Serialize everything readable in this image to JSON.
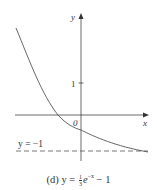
{
  "axes": {
    "x_label": "x",
    "y_label": "y",
    "origin_label": "0",
    "y_tick_label": "1"
  },
  "asymptote": {
    "label": "y = −1",
    "style": "dashed"
  },
  "caption": {
    "prefix": "(d) y = ",
    "frac_num": "1",
    "frac_den": "3",
    "base": "e",
    "exponent": "−x",
    "suffix": " − 1"
  },
  "colors": {
    "curve": "#555555",
    "axis": "#444444",
    "text": "#333333"
  }
}
